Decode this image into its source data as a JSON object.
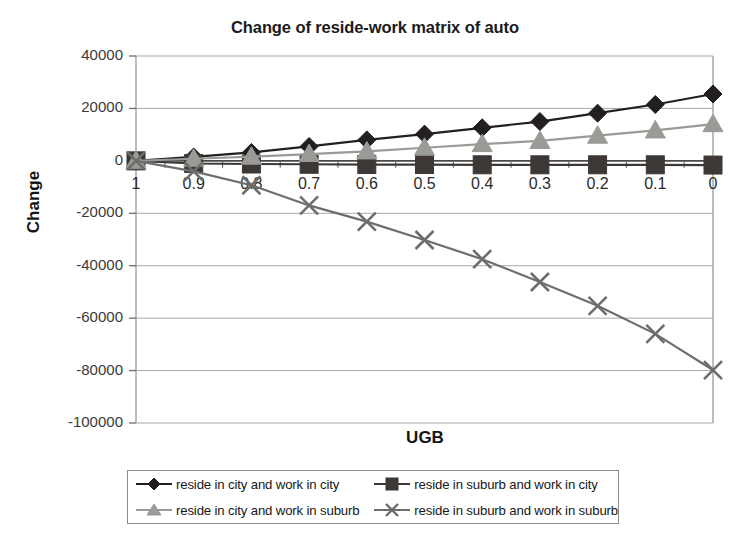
{
  "chart_data": {
    "type": "line",
    "title": "Change of reside-work matrix of auto",
    "xlabel": "UGB",
    "ylabel": "Change",
    "categories": [
      "1",
      "0.9",
      "0.8",
      "0.7",
      "0.6",
      "0.5",
      "0.4",
      "0.3",
      "0.2",
      "0.1",
      "0"
    ],
    "x_tick_labels": [
      "1",
      "0.9",
      "0.8",
      "0.7",
      "0.6",
      "0.5",
      "0.4",
      "0.3",
      "0.2",
      "0.1",
      "0"
    ],
    "y_tick_labels": [
      "40000",
      "20000",
      "0",
      "-20000",
      "-40000",
      "-60000",
      "-80000",
      "-100000"
    ],
    "y_ticks": [
      40000,
      20000,
      0,
      -20000,
      -40000,
      -60000,
      -80000,
      -100000
    ],
    "ylim": [
      -100000,
      40000
    ],
    "grid": true,
    "legend_position": "bottom",
    "series": [
      {
        "name": "reside in city and work in city",
        "marker": "diamond",
        "color": "#231f20",
        "values": [
          0,
          1500,
          3200,
          5500,
          8000,
          10200,
          12600,
          15000,
          18200,
          21500,
          25500
        ]
      },
      {
        "name": "reside in suburb and work in city",
        "marker": "square",
        "color": "#3d3836",
        "values": [
          0,
          -1000,
          -1200,
          -1300,
          -1400,
          -1400,
          -1500,
          -1500,
          -1500,
          -1500,
          -1600
        ]
      },
      {
        "name": "reside in city and work in suburb",
        "marker": "triangle",
        "color": "#9a9a96",
        "values": [
          0,
          800,
          1600,
          2600,
          3600,
          5000,
          6400,
          7600,
          9600,
          11600,
          14000
        ]
      },
      {
        "name": "reside in suburb and work in suburb",
        "marker": "cross",
        "color": "#6d6d6b",
        "values": [
          0,
          -4000,
          -9300,
          -17000,
          -23200,
          -30200,
          -37500,
          -46200,
          -55300,
          -66000,
          -79800
        ]
      }
    ]
  },
  "legend": {
    "entries": [
      "reside in city and work in city",
      "reside in suburb and work in city",
      "reside in city and work in suburb",
      "reside in suburb and work in suburb"
    ]
  }
}
